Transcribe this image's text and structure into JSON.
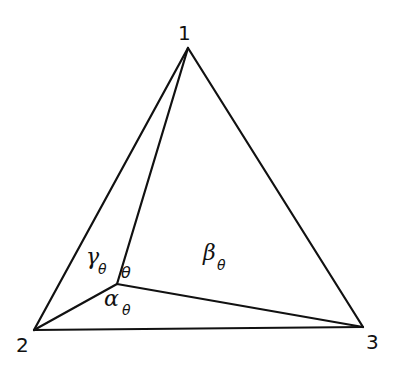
{
  "diagram": {
    "type": "triangle-with-interior-point",
    "vertices": [
      {
        "id": "1",
        "label": "1",
        "x": 188,
        "y": 48,
        "label_x": 178,
        "label_y": 40
      },
      {
        "id": "2",
        "label": "2",
        "x": 34,
        "y": 330,
        "label_x": 16,
        "label_y": 352
      },
      {
        "id": "3",
        "label": "3",
        "x": 363,
        "y": 327,
        "label_x": 366,
        "label_y": 349
      }
    ],
    "interior_point": {
      "id": "theta",
      "label": "θ",
      "x": 117,
      "y": 284,
      "label_x": 121,
      "label_y": 278
    },
    "edges": [
      {
        "from": "1",
        "to": "2"
      },
      {
        "from": "1",
        "to": "3"
      },
      {
        "from": "2",
        "to": "3"
      },
      {
        "from": "theta",
        "to": "1"
      },
      {
        "from": "theta",
        "to": "2"
      },
      {
        "from": "theta",
        "to": "3"
      }
    ],
    "region_labels": {
      "gamma": {
        "symbol": "γ",
        "subscript": "θ",
        "x": 86,
        "y": 266
      },
      "beta": {
        "symbol": "β",
        "subscript": "θ",
        "x": 203,
        "y": 262
      },
      "alpha": {
        "symbol": "α",
        "subscript": "θ",
        "x": 104,
        "y": 306
      }
    }
  }
}
